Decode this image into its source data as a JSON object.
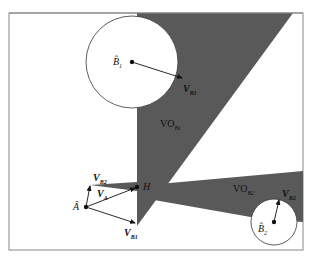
{
  "diagram": {
    "colors": {
      "background": "#ffffff",
      "frame": "#888888",
      "vo_fill": "#595959",
      "vo_overlap_fill": "#3f3f3f",
      "stroke": "#222222",
      "circle_fill": "#ffffff"
    },
    "labels": {
      "agent": {
        "main": "Â",
        "sub": ""
      },
      "obstacle1": {
        "main": "B̂",
        "sub": "1"
      },
      "obstacle2": {
        "main": "B̂",
        "sub": "2"
      },
      "vo1": {
        "main": "VO",
        "sub": "B1"
      },
      "vo2": {
        "main": "VO",
        "sub": "B2"
      },
      "point_h": {
        "main": "H"
      },
      "v_a": {
        "main": "V",
        "sub": "A"
      },
      "v_b1_at_a": {
        "main": "V",
        "sub": "B1"
      },
      "v_b2_at_a": {
        "main": "V",
        "sub": "B2"
      },
      "v_b1_at_b1": {
        "main": "V",
        "sub": "B1"
      },
      "v_b2_at_b2": {
        "main": "V",
        "sub": "B2"
      }
    }
  }
}
